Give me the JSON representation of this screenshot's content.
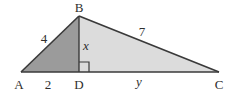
{
  "diagram": {
    "type": "geometry",
    "colors": {
      "left_fill": "#9b9b9b",
      "right_fill": "#dcdcdc",
      "stroke": "#3a3a3a",
      "background": "#ffffff"
    },
    "points": {
      "A": {
        "label": "A",
        "x": 21,
        "y": 72
      },
      "B": {
        "label": "B",
        "x": 79,
        "y": 16
      },
      "C": {
        "label": "C",
        "x": 219,
        "y": 72
      },
      "D": {
        "label": "D",
        "x": 79,
        "y": 72
      }
    },
    "segments": {
      "AB": {
        "label": "4"
      },
      "AD": {
        "label": "2"
      },
      "BD": {
        "label": "x"
      },
      "BC": {
        "label": "7"
      },
      "DC": {
        "label": "y"
      }
    },
    "right_angle": {
      "at": "D",
      "size": 10
    }
  }
}
